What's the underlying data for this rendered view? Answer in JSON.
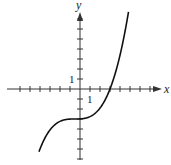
{
  "chart_data": {
    "type": "line",
    "title": "",
    "xlabel": "x",
    "ylabel": "y",
    "tick_labels": {
      "x": "1",
      "y": "1"
    },
    "xlim": [
      -7,
      8
    ],
    "ylim": [
      -7,
      8
    ],
    "grid": false,
    "function": "y = 0.07*(x+0.5)^3 - 3",
    "x": [
      -4.0,
      -3.0,
      -2.0,
      -1.0,
      -0.5,
      0.0,
      1.0,
      2.0,
      3.0,
      4.0,
      4.8
    ],
    "series": [
      {
        "name": "f(x)",
        "values": [
          -6.0,
          -4.0,
          -3.1,
          -3.0,
          -3.0,
          -3.0,
          -2.8,
          -1.9,
          0.0,
          3.0,
          7.4
        ]
      }
    ],
    "features": {
      "x_intercept": 3,
      "y_intercept": -3
    }
  }
}
